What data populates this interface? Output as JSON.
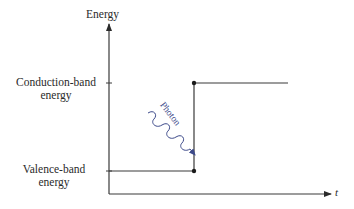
{
  "diagram": {
    "type": "energy-time step diagram",
    "axes": {
      "y_label": "Energy",
      "x_label": "t"
    },
    "levels": {
      "conduction": {
        "label_line1": "Conduction-band",
        "label_line2": "energy"
      },
      "valence": {
        "label_line1": "Valence-band",
        "label_line2": "energy"
      }
    },
    "annotation": {
      "photon_label": "Photon"
    },
    "colors": {
      "line": "#3a3a3a",
      "photon": "#3d4a8a",
      "text": "#2a2a2a"
    }
  }
}
